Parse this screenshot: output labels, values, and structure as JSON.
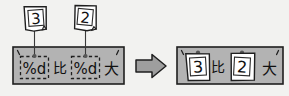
{
  "diagram": {
    "type": "string-format-substitution",
    "background_color": "#f2f2f0",
    "ink_color": "#1a1a1a",
    "box_fill": "#b3b3b3",
    "note_fill": "#ffffff",
    "arrow_fill": "#9e9e9e"
  },
  "notes": [
    {
      "id": "note-3",
      "value": "3",
      "name": "sticky-note-3"
    },
    {
      "id": "note-2",
      "value": "2",
      "name": "sticky-note-2"
    }
  ],
  "format_string": {
    "label": "format-string-box",
    "open_quote": "'",
    "close_quote": "'",
    "tokens": [
      {
        "kind": "placeholder",
        "text": "%d"
      },
      {
        "kind": "literal",
        "text": "比"
      },
      {
        "kind": "placeholder",
        "text": "%d"
      },
      {
        "kind": "literal",
        "text": "大"
      }
    ],
    "full_text": "%d比%d大"
  },
  "arrow": {
    "name": "right-arrow-icon",
    "direction": "right"
  },
  "result_string": {
    "label": "result-string-box",
    "open_quote": "'",
    "close_quote": "'",
    "tokens": [
      {
        "kind": "note",
        "text": "3"
      },
      {
        "kind": "literal",
        "text": "比"
      },
      {
        "kind": "note",
        "text": "2"
      },
      {
        "kind": "literal",
        "text": "大"
      }
    ],
    "full_text": "3比2大"
  }
}
